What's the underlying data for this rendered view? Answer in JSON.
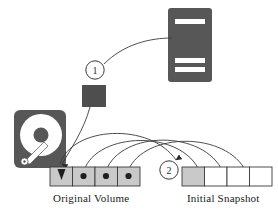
{
  "diagram": {
    "colors": {
      "dark_fill": "#575757",
      "cell_shaded": "#c9c9c9",
      "cell_white": "#ffffff",
      "stroke": "#3a3a3a",
      "text": "#1a1a1a",
      "background": "#ffffff"
    },
    "labels": {
      "original_volume": "Original Volume",
      "initial_snapshot": "Initial Snapshot"
    },
    "badges": [
      {
        "id": "badge-1",
        "text": "1",
        "cx": 95,
        "cy": 70,
        "r": 9
      },
      {
        "id": "badge-2",
        "text": "2",
        "cx": 169,
        "cy": 170,
        "r": 9
      }
    ],
    "server": {
      "name": "server-tower-icon",
      "x": 168,
      "y": 8,
      "width": 44,
      "height": 74,
      "slots": [
        {
          "x": 175,
          "y": 20,
          "width": 30,
          "height": 5
        },
        {
          "x": 175,
          "y": 59,
          "width": 30,
          "height": 5
        },
        {
          "x": 175,
          "y": 68,
          "width": 30,
          "height": 5
        }
      ]
    },
    "harddisk": {
      "name": "hard-disk-icon",
      "x": 14,
      "y": 110,
      "width": 52,
      "height": 58,
      "platter_cx": 41,
      "platter_cy": 136,
      "platter_r": 21,
      "hub_r": 7
    },
    "data_block": {
      "name": "data-block",
      "x": 82,
      "y": 85,
      "width": 24,
      "height": 22
    },
    "original_volume": {
      "name": "original-volume-bar",
      "x": 50,
      "y": 167,
      "width": 90,
      "height": 19,
      "cells": [
        {
          "index": 0,
          "fill": "shaded",
          "marker": "arrow-down"
        },
        {
          "index": 1,
          "fill": "shaded",
          "marker": "dot"
        },
        {
          "index": 2,
          "fill": "shaded",
          "marker": "dot"
        },
        {
          "index": 3,
          "fill": "shaded",
          "marker": "dot"
        }
      ]
    },
    "initial_snapshot": {
      "name": "initial-snapshot-bar",
      "x": 182,
      "y": 167,
      "width": 90,
      "height": 19,
      "cells": [
        {
          "index": 0,
          "fill": "shaded",
          "marker": "arrow-down"
        },
        {
          "index": 1,
          "fill": "white",
          "marker": "none"
        },
        {
          "index": 2,
          "fill": "white",
          "marker": "none"
        },
        {
          "index": 3,
          "fill": "white",
          "marker": "none"
        }
      ]
    },
    "connectors": [
      {
        "name": "server-to-badge1",
        "kind": "curve"
      },
      {
        "name": "block-to-volume-cell0",
        "kind": "curve-arrow"
      },
      {
        "name": "volume-cell0-to-snapshot-cell0",
        "kind": "arc-arrow"
      },
      {
        "name": "volume-cell1-to-snapshot-cell1",
        "kind": "arc"
      },
      {
        "name": "volume-cell2-to-snapshot-cell2",
        "kind": "arc"
      },
      {
        "name": "volume-cell3-to-snapshot-cell3",
        "kind": "arc"
      }
    ]
  }
}
